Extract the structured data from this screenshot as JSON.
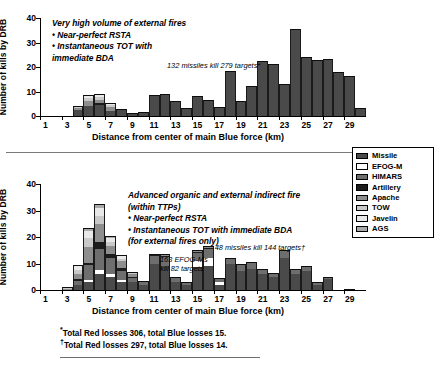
{
  "legend": {
    "title": "Weapon systems",
    "items": [
      {
        "label": "Missile",
        "color": "#4a4a4a"
      },
      {
        "label": "EFOG-M",
        "color": "#ffffff"
      },
      {
        "label": "HIMARS",
        "color": "#6e6e6e"
      },
      {
        "label": "Artillery",
        "color": "#1c1c1c"
      },
      {
        "label": "Apache",
        "color": "#8e8e8e"
      },
      {
        "label": "TOW",
        "color": "#c9c9c9"
      },
      {
        "label": "Javelin",
        "color": "#e8e8e8"
      },
      {
        "label": "AGS",
        "color": "#a8a8a8"
      }
    ]
  },
  "footnotes": [
    {
      "mark": "*",
      "text": "Total Red losses 306, total Blue losses 15."
    },
    {
      "mark": "†",
      "text": "Total Red losses 297, total Blue losses 14."
    }
  ],
  "chart_data": [
    {
      "id": "top",
      "type": "bar",
      "stacked": true,
      "title": "",
      "xlabel": "Distance from center of main Blue force (km)",
      "ylabel": "Number of kills by DRB",
      "ylim": [
        0,
        40
      ],
      "yticks": [
        0,
        10,
        20,
        30,
        40
      ],
      "xticks": [
        1,
        3,
        5,
        7,
        9,
        11,
        13,
        15,
        17,
        19,
        21,
        23,
        25,
        27,
        29
      ],
      "xlim": [
        0.5,
        30.5
      ],
      "grid": false,
      "legend_position": "right-outside",
      "annotations": [
        {
          "name": "scenario-note",
          "text": "Very high volume of external fires\n  • Near-perfect RSTA\n  • Instantaneous TOT with\n      immediate BDA",
          "x": 52,
          "y": 18
        },
        {
          "name": "missile-kill-note",
          "text": "132 missiles kill 279 targets*",
          "x": 167,
          "y": 61
        }
      ],
      "categories": [
        1,
        2,
        3,
        4,
        5,
        6,
        7,
        8,
        9,
        10,
        11,
        12,
        13,
        14,
        15,
        16,
        17,
        18,
        19,
        20,
        21,
        22,
        23,
        24,
        25,
        26,
        27,
        28,
        29,
        30
      ],
      "series": [
        {
          "name": "Missile",
          "values": [
            0,
            0,
            0,
            2.6,
            4.2,
            4.6,
            2.2,
            3.0,
            1.2,
            1.5,
            8.5,
            8.9,
            6.3,
            3.2,
            8.0,
            6.4,
            3.5,
            18.2,
            6.1,
            12.2,
            22.3,
            21.1,
            13.0,
            35.5,
            24.1,
            22.8,
            23.1,
            18.0,
            16.3,
            3.2
          ]
        },
        {
          "name": "EFOG-M",
          "values": [
            0,
            0,
            0,
            0,
            0,
            0,
            0,
            0,
            0,
            0,
            0,
            0,
            0,
            0,
            0,
            0,
            0,
            0,
            0,
            0,
            0,
            0,
            0,
            0,
            0,
            0,
            0,
            0,
            0,
            0
          ]
        },
        {
          "name": "HIMARS",
          "values": [
            0,
            0,
            0,
            0,
            0,
            0,
            0,
            0,
            0,
            0,
            0,
            0,
            0,
            0,
            0,
            0,
            0,
            0,
            0,
            0,
            0,
            0,
            0,
            0,
            0,
            0,
            0,
            0,
            0,
            0
          ]
        },
        {
          "name": "Artillery",
          "values": [
            0,
            0,
            0,
            0,
            0,
            0.6,
            0,
            0,
            0,
            0,
            0,
            0,
            0,
            0,
            0,
            0,
            0,
            0,
            0,
            0,
            0,
            0,
            0,
            0,
            0,
            0,
            0,
            0,
            0,
            0
          ]
        },
        {
          "name": "Apache",
          "values": [
            0,
            0,
            0,
            0.8,
            2.1,
            1.3,
            1.5,
            0,
            0,
            0,
            0,
            0,
            0,
            0,
            0,
            0,
            0,
            0,
            0,
            0,
            0,
            0,
            0,
            0,
            0,
            0,
            0,
            0,
            0,
            0
          ]
        },
        {
          "name": "TOW",
          "values": [
            0,
            0,
            0,
            0.4,
            0.9,
            1.1,
            0.8,
            0,
            0,
            0,
            0,
            0,
            0,
            0,
            0,
            0,
            0,
            0,
            0,
            0,
            0,
            0,
            0,
            0,
            0,
            0,
            0,
            0,
            0,
            0
          ]
        },
        {
          "name": "Javelin",
          "values": [
            0,
            0,
            0,
            0.2,
            1.3,
            1.5,
            1.0,
            0,
            0,
            0,
            0,
            0,
            0,
            0,
            0,
            0,
            0,
            0,
            0,
            0,
            0,
            0,
            0,
            0,
            0,
            0,
            0,
            0,
            0,
            0
          ]
        },
        {
          "name": "AGS",
          "values": [
            0,
            0,
            0,
            0,
            0,
            0,
            0,
            0,
            0,
            0,
            0,
            0,
            0,
            0,
            0,
            0,
            0,
            0,
            0,
            0,
            0,
            0,
            0,
            0,
            0,
            0,
            0,
            0,
            0,
            0
          ]
        }
      ]
    },
    {
      "id": "bottom",
      "type": "bar",
      "stacked": true,
      "title": "",
      "xlabel": "Distance from center of main Blue force (km)",
      "ylabel": "Number of kills by DRB",
      "ylim": [
        0,
        40
      ],
      "yticks": [
        0,
        10,
        20,
        30,
        40
      ],
      "xticks": [
        1,
        3,
        5,
        7,
        9,
        11,
        13,
        15,
        17,
        19,
        21,
        23,
        25,
        27,
        29
      ],
      "xlim": [
        0.5,
        30.5
      ],
      "grid": false,
      "legend_position": "right-outside",
      "annotations": [
        {
          "name": "scenario-note",
          "text": "Advanced organic and external indirect fire\n(within TTPs)\n   • Near-perfect RSTA\n   • Instantaneous TOT with immediate BDA\n      (for external fires only)",
          "x": 128,
          "y": 190
        },
        {
          "name": "efogm-kill-note",
          "text": "163 EFOG-Ms\nkill 82 targets",
          "x": 160,
          "y": 255
        },
        {
          "name": "missile-kill-note",
          "text": "48 missiles kill 144 targets†",
          "x": 305,
          "y": 243
        }
      ],
      "categories": [
        1,
        2,
        3,
        4,
        5,
        6,
        7,
        8,
        9,
        10,
        11,
        12,
        13,
        14,
        15,
        16,
        17,
        18,
        19,
        20,
        21,
        22,
        23,
        24,
        25,
        26,
        27,
        28,
        29,
        30
      ],
      "series": [
        {
          "name": "Missile",
          "values": [
            0,
            0,
            0,
            2.0,
            3.0,
            6.0,
            5.0,
            3.0,
            3.0,
            2.0,
            10.0,
            9.0,
            3.0,
            2.0,
            8.5,
            9.0,
            2.0,
            10.0,
            7.0,
            8.0,
            6.0,
            5.0,
            12.0,
            6.0,
            7.0,
            2.0,
            4.0,
            0,
            0.5,
            0
          ]
        },
        {
          "name": "EFOG-M",
          "values": [
            0,
            0,
            0,
            0,
            0.8,
            1.5,
            1.2,
            0.8,
            0,
            0,
            0,
            0,
            0,
            0,
            2.5,
            3.0,
            1.0,
            0,
            0,
            0,
            0,
            0,
            0,
            0,
            0,
            0,
            0,
            0,
            0,
            0
          ]
        },
        {
          "name": "HIMARS",
          "values": [
            0,
            0,
            0,
            1.5,
            5.5,
            8.0,
            6.0,
            3.5,
            1.5,
            1.0,
            3.0,
            3.5,
            2.0,
            1.0,
            3.0,
            3.5,
            1.5,
            2.0,
            3.0,
            2.5,
            2.0,
            1.5,
            3.0,
            2.0,
            2.0,
            1.0,
            1.0,
            0,
            0,
            0
          ]
        },
        {
          "name": "Artillery",
          "values": [
            0,
            0,
            0,
            0.5,
            1.0,
            2.5,
            1.5,
            1.0,
            0.5,
            0,
            0.5,
            0.5,
            0,
            0,
            0.5,
            0.5,
            0,
            0,
            0,
            0,
            0,
            0,
            0,
            0,
            0,
            0,
            0,
            0,
            0,
            0
          ]
        },
        {
          "name": "Apache",
          "values": [
            0,
            0,
            0.5,
            2.0,
            6.0,
            7.0,
            3.0,
            2.5,
            1.0,
            0.5,
            0,
            0.5,
            0,
            0,
            0.5,
            0.5,
            0,
            0,
            0,
            0,
            0,
            0,
            0,
            0,
            0,
            0,
            0,
            0,
            0,
            0
          ]
        },
        {
          "name": "TOW",
          "values": [
            0,
            0,
            0.3,
            1.5,
            3.5,
            3.0,
            1.5,
            1.0,
            0.5,
            0,
            0,
            0,
            0,
            0,
            0,
            0,
            0,
            0,
            0,
            0,
            0,
            0,
            0,
            0,
            0,
            0,
            0,
            0,
            0,
            0
          ]
        },
        {
          "name": "Javelin",
          "values": [
            0,
            0,
            0.2,
            1.5,
            2.5,
            3.0,
            1.5,
            1.0,
            0.5,
            0,
            0,
            0,
            0,
            0,
            0,
            0,
            0,
            0,
            0,
            0,
            0,
            0,
            0,
            0,
            0,
            0,
            0,
            0,
            0,
            0
          ]
        },
        {
          "name": "AGS",
          "values": [
            0,
            0,
            0,
            0.5,
            1.0,
            1.5,
            0.8,
            0.5,
            0,
            0,
            0,
            0,
            0,
            0,
            0,
            0,
            0,
            0,
            0,
            0,
            0,
            0,
            0,
            0,
            0,
            0,
            0,
            0,
            0,
            0
          ]
        }
      ]
    }
  ]
}
